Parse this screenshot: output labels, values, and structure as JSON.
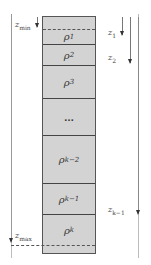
{
  "diagram": {
    "type": "layered-column",
    "layers": [
      {
        "symbol": "ρ",
        "sub": "1"
      },
      {
        "symbol": "ρ",
        "sub": "2"
      },
      {
        "symbol": "ρ",
        "sub": "3"
      },
      {
        "symbol": "…",
        "sub": ""
      },
      {
        "symbol": "ρ",
        "sub": "k−2"
      },
      {
        "symbol": "ρ",
        "sub": "k−1"
      },
      {
        "symbol": "ρ",
        "sub": "k"
      }
    ],
    "left_labels": {
      "zmin": {
        "symbol": "z",
        "sub": "min"
      },
      "zmax": {
        "symbol": "z",
        "sub": "max"
      }
    },
    "right_labels": [
      {
        "symbol": "z",
        "sub": "1"
      },
      {
        "symbol": "z",
        "sub": "2"
      },
      {
        "symbol": "z",
        "sub": "k−1"
      }
    ],
    "colors": {
      "fill": "#d3d3d3",
      "border": "#444444",
      "guide": "#bdbdbd"
    }
  }
}
